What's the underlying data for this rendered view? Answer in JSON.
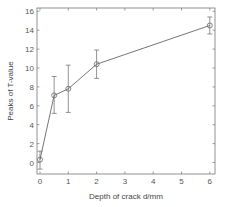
{
  "chart_data": {
    "type": "line",
    "title": "",
    "xlabel": "Depth of crack d/mm",
    "ylabel": "Peaks of T-value",
    "xlim": [
      -0.3,
      6.2
    ],
    "ylim": [
      -1,
      16.5
    ],
    "xticks": [
      0,
      1,
      2,
      3,
      4,
      5,
      6
    ],
    "yticks": [
      0,
      2,
      4,
      6,
      8,
      10,
      12,
      14,
      16
    ],
    "grid": false,
    "legend": null,
    "series": [
      {
        "name": "Peaks of T-value",
        "marker": "circle",
        "x": [
          0,
          0.5,
          1,
          2,
          6
        ],
        "y": [
          0.3,
          7.1,
          7.8,
          10.4,
          14.5
        ],
        "error_lower": [
          -0.7,
          5.2,
          5.3,
          8.9,
          13.6
        ],
        "error_upper": [
          1.2,
          9.1,
          10.3,
          11.9,
          15.4
        ]
      }
    ]
  },
  "colors": {
    "line": "#666666",
    "axis": "#777777",
    "text": "#555555"
  }
}
